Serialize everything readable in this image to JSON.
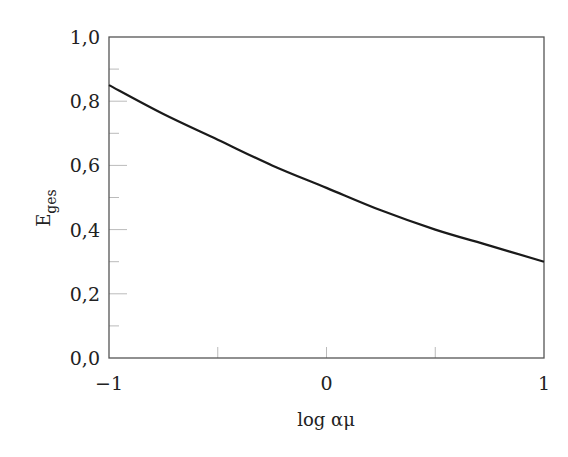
{
  "chart_data": {
    "type": "line",
    "title": "",
    "xlabel": "log αμ",
    "ylabel": "E",
    "ylabel_sub": "ges",
    "xlim": [
      -1,
      1
    ],
    "ylim": [
      0,
      1
    ],
    "x_ticks": [
      -1,
      0,
      1
    ],
    "x_tick_labels": [
      "−1",
      "0",
      "1"
    ],
    "x_minor_ticks": [
      -0.5,
      0,
      0.5
    ],
    "y_ticks": [
      0,
      0.2,
      0.4,
      0.6,
      0.8,
      1.0
    ],
    "y_tick_labels": [
      "0,0",
      "0,2",
      "0,4",
      "0,6",
      "0,8",
      "1,0"
    ],
    "y_minor_ticks": [
      0.1,
      0.2,
      0.3,
      0.4,
      0.5,
      0.6,
      0.7,
      0.8,
      0.9
    ],
    "grid": false,
    "legend": null,
    "series": [
      {
        "name": "E_ges",
        "x": [
          -1,
          -0.75,
          -0.5,
          -0.25,
          0,
          0.25,
          0.5,
          0.75,
          1
        ],
        "values": [
          0.85,
          0.76,
          0.68,
          0.6,
          0.53,
          0.46,
          0.4,
          0.35,
          0.3
        ]
      }
    ],
    "colors": {
      "line": "#1a1a1a",
      "axis": "#555555",
      "tick": "#bbbbbb"
    }
  }
}
